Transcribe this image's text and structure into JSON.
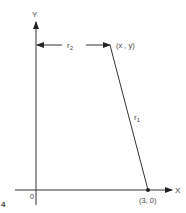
{
  "figure": {
    "number": "4",
    "axes": {
      "x_label": "X",
      "y_label": "Y",
      "origin_label": "0"
    },
    "points": {
      "moving_point": "(x , y)",
      "fixed_point": "(3, 0)"
    },
    "segments": {
      "r1": {
        "base": "r",
        "subscript": "1"
      },
      "r2": {
        "base": "r",
        "subscript": "2"
      }
    },
    "colors": {
      "stroke": "#333333",
      "text": "#444444"
    }
  }
}
